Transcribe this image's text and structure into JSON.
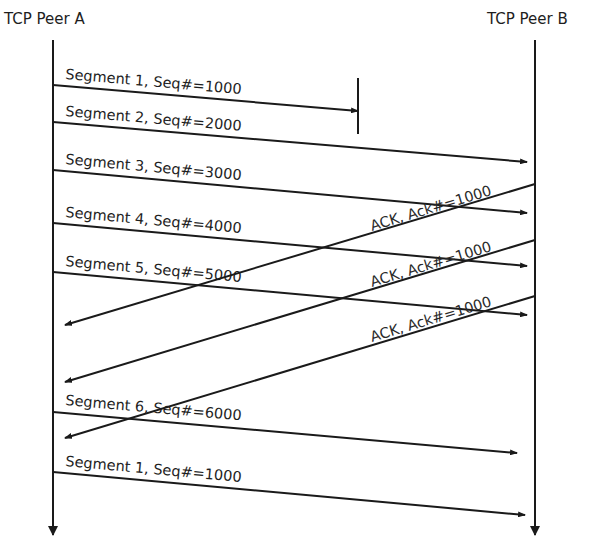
{
  "peers": {
    "a": {
      "label": "TCP Peer A",
      "x": 53
    },
    "b": {
      "label": "TCP Peer B",
      "x": 535
    }
  },
  "messages": [
    {
      "id": "seg1",
      "label": "Segment 1, Seq#=1000",
      "from": "A",
      "x1": 53,
      "y1": 85,
      "x2": 358,
      "y2": 111,
      "status": "lost"
    },
    {
      "id": "seg2",
      "label": "Segment 2, Seq#=2000",
      "from": "A",
      "x1": 53,
      "y1": 122,
      "x2": 527,
      "y2": 162
    },
    {
      "id": "seg3",
      "label": "Segment 3, Seq#=3000",
      "from": "A",
      "x1": 53,
      "y1": 170,
      "x2": 527,
      "y2": 213
    },
    {
      "id": "seg4",
      "label": "Segment 4, Seq#=4000",
      "from": "A",
      "x1": 53,
      "y1": 223,
      "x2": 527,
      "y2": 266
    },
    {
      "id": "seg5",
      "label": "Segment 5, Seq#=5000",
      "from": "A",
      "x1": 53,
      "y1": 272,
      "x2": 527,
      "y2": 315
    },
    {
      "id": "ack1",
      "label": "ACK, Ack#=1000",
      "from": "B",
      "x1": 535,
      "y1": 184,
      "x2": 65,
      "y2": 325
    },
    {
      "id": "ack2",
      "label": "ACK, Ack#=1000",
      "from": "B",
      "x1": 535,
      "y1": 240,
      "x2": 65,
      "y2": 382
    },
    {
      "id": "ack3",
      "label": "ACK, Ack#=1000",
      "from": "B",
      "x1": 535,
      "y1": 296,
      "x2": 65,
      "y2": 438
    },
    {
      "id": "seg6",
      "label": "Segment 6, Seq#=6000",
      "from": "A",
      "x1": 53,
      "y1": 412,
      "x2": 517,
      "y2": 453
    },
    {
      "id": "seg1-retransmit",
      "label": "Segment 1, Seq#=1000",
      "from": "A",
      "x1": 53,
      "y1": 472,
      "x2": 525,
      "y2": 515
    }
  ],
  "loss_marker": {
    "x": 358,
    "y1": 78,
    "y2": 134
  }
}
